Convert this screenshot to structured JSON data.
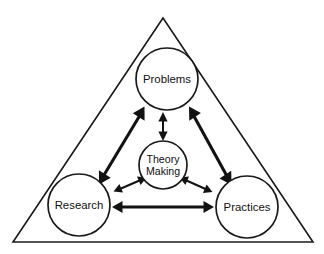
{
  "diagram": {
    "type": "triangle-relationship-diagram",
    "background_color": "#ffffff",
    "line_color": "#1a1a1a",
    "arrow_color": "#121212",
    "frame": {
      "name": "triangle",
      "apex": {
        "x": 163,
        "y": 18
      },
      "bottom_left": {
        "x": 13,
        "y": 242
      },
      "bottom_right": {
        "x": 313,
        "y": 242
      }
    },
    "nodes": [
      {
        "id": "problems",
        "label": "Problems",
        "cx": 167,
        "cy": 79,
        "r": 31,
        "role": "corner"
      },
      {
        "id": "research",
        "label": "Research",
        "cx": 79,
        "cy": 205,
        "r": 31,
        "role": "corner"
      },
      {
        "id": "practices",
        "label": "Practices",
        "cx": 247,
        "cy": 207,
        "r": 31,
        "role": "corner"
      },
      {
        "id": "theory-making",
        "label_line_1": "Theory",
        "label_line_2": "Making",
        "cx": 163,
        "cy": 165,
        "r": 24,
        "role": "center"
      }
    ],
    "connections": [
      {
        "id": "research-problems",
        "from": "research",
        "to": "problems",
        "weight": "major",
        "bidirectional": true
      },
      {
        "id": "problems-practices",
        "from": "problems",
        "to": "practices",
        "weight": "major",
        "bidirectional": true
      },
      {
        "id": "research-practices",
        "from": "research",
        "to": "practices",
        "weight": "major",
        "bidirectional": true
      },
      {
        "id": "theory-problems",
        "from": "theory-making",
        "to": "problems",
        "weight": "minor",
        "bidirectional": true
      },
      {
        "id": "theory-research",
        "from": "theory-making",
        "to": "research",
        "weight": "minor",
        "bidirectional": true
      },
      {
        "id": "theory-practices",
        "from": "theory-making",
        "to": "practices",
        "weight": "minor",
        "bidirectional": true
      }
    ]
  }
}
